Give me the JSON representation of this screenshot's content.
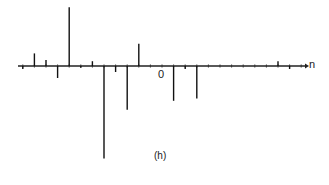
{
  "chart_data": {
    "type": "stem",
    "title": "",
    "caption": "(h)",
    "xlabel": "n",
    "ylabel": "",
    "x_tick_labels": [
      {
        "n": 0,
        "label": "0"
      }
    ],
    "grid": false,
    "legend": null,
    "n": [
      -12,
      -11,
      -10,
      -9,
      -8,
      -7,
      -6,
      -5,
      -4,
      -3,
      -2,
      -1,
      0,
      1,
      2,
      3,
      4,
      5,
      6,
      7,
      8,
      9,
      10,
      11,
      12
    ],
    "values": [
      -0.05,
      0.21,
      0.1,
      -0.2,
      0.98,
      -0.03,
      0.08,
      -1.54,
      -0.1,
      -0.73,
      0.37,
      0.0,
      0.0,
      -0.58,
      -0.05,
      -0.54,
      0.0,
      0.0,
      0.0,
      0.0,
      0.0,
      0.0,
      0.08,
      -0.05,
      0.0
    ],
    "value_note": "Relative amplitudes read off pixel heights (normalized so largest positive ≈ 1); no y-axis scale shown"
  },
  "labels": {
    "zero": "0",
    "axis": "n",
    "caption": "(h)"
  }
}
